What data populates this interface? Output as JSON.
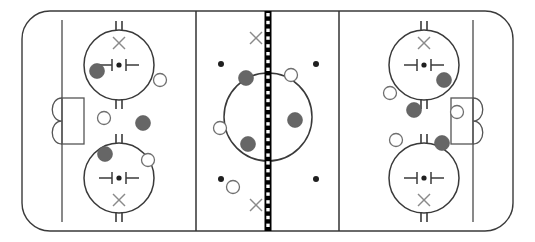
{
  "diagram": {
    "type": "hockey-rink-play-diagram",
    "canvas": {
      "width": 535,
      "height": 242
    },
    "colors": {
      "background": "#ffffff",
      "boundary": "#3a3a3a",
      "zone_line": "#333333",
      "center_line_black": "#000000",
      "center_line_white": "#ffffff",
      "goal_line": "#4a4a4a",
      "crease": "#555555",
      "faceoff_circle": "#3a3a3a",
      "x_mark": "#8a8a8a",
      "dot": "#1f1f1f",
      "player_filled": "#666666",
      "player_open_stroke": "#6f6f6f",
      "player_open_fill": "#ffffff"
    }
  },
  "rink": {
    "boundary": {
      "x": 22,
      "y": 11,
      "width": 491,
      "height": 220,
      "corner_radius": 28
    },
    "zone_lines": [
      {
        "name": "left-blue-line",
        "x": 196,
        "y1": 11,
        "y2": 231
      },
      {
        "name": "right-blue-line",
        "x": 339,
        "y1": 11,
        "y2": 231
      }
    ],
    "center_line": {
      "name": "center-red-line",
      "x": 268,
      "y1": 11,
      "y2": 231,
      "bar_width": 7,
      "segment_height": 7.8,
      "inner_square": 3.4
    },
    "goal_lines": [
      {
        "name": "left-goal-line",
        "x": 62,
        "y1": 20,
        "y2": 222
      },
      {
        "name": "right-goal-line",
        "x": 473,
        "y1": 20,
        "y2": 222
      }
    ],
    "goals": [
      {
        "name": "left-goal",
        "crease": {
          "x": 62,
          "y": 98,
          "width": 22,
          "height": 46
        },
        "net_side": "left"
      },
      {
        "name": "right-goal",
        "crease": {
          "x": 451,
          "y": 98,
          "width": 22,
          "height": 46
        },
        "net_side": "right"
      }
    ],
    "faceoff_circles": [
      {
        "name": "faceoff-circle-top-left",
        "cx": 119,
        "cy": 65,
        "r": 35,
        "x_mark": "above"
      },
      {
        "name": "faceoff-circle-bottom-left",
        "cx": 119,
        "cy": 178,
        "r": 35,
        "x_mark": "below"
      },
      {
        "name": "faceoff-circle-top-right",
        "cx": 424,
        "cy": 65,
        "r": 35,
        "x_mark": "above"
      },
      {
        "name": "faceoff-circle-bottom-right",
        "cx": 424,
        "cy": 178,
        "r": 35,
        "x_mark": "below"
      },
      {
        "name": "faceoff-circle-center",
        "cx": 268,
        "cy": 117,
        "r": 44,
        "x_mark": "none"
      }
    ],
    "neutral_zone_dots": [
      {
        "name": "neutral-dot-top-left",
        "cx": 221,
        "cy": 64
      },
      {
        "name": "neutral-dot-top-right",
        "cx": 316,
        "cy": 64
      },
      {
        "name": "neutral-dot-bottom-left",
        "cx": 221,
        "cy": 179
      },
      {
        "name": "neutral-dot-bottom-right",
        "cx": 316,
        "cy": 179
      }
    ],
    "neutral_zone_x_marks": [
      {
        "name": "neutral-x-top",
        "cx": 256,
        "cy": 38
      },
      {
        "name": "neutral-x-bottom",
        "cx": 256,
        "cy": 205
      }
    ]
  },
  "players": {
    "filled_label": "Defending / dark team player",
    "open_label": "Attacking / light team player",
    "filled": [
      {
        "name": "player-dark-1",
        "cx": 97,
        "cy": 71,
        "r": 7.5
      },
      {
        "name": "player-dark-2",
        "cx": 143,
        "cy": 123,
        "r": 7.5
      },
      {
        "name": "player-dark-3",
        "cx": 105,
        "cy": 154,
        "r": 7.5
      },
      {
        "name": "player-dark-4",
        "cx": 246,
        "cy": 78,
        "r": 7.5
      },
      {
        "name": "player-dark-5",
        "cx": 295,
        "cy": 120,
        "r": 7.5
      },
      {
        "name": "player-dark-6",
        "cx": 248,
        "cy": 144,
        "r": 7.5
      },
      {
        "name": "player-dark-7",
        "cx": 444,
        "cy": 80,
        "r": 7.5
      },
      {
        "name": "player-dark-8",
        "cx": 414,
        "cy": 110,
        "r": 7.5
      },
      {
        "name": "player-dark-9",
        "cx": 442,
        "cy": 143,
        "r": 7.5
      }
    ],
    "open": [
      {
        "name": "player-light-1",
        "cx": 160,
        "cy": 80,
        "r": 6.5
      },
      {
        "name": "player-light-2",
        "cx": 104,
        "cy": 118,
        "r": 6.5
      },
      {
        "name": "player-light-3",
        "cx": 148,
        "cy": 160,
        "r": 6.5
      },
      {
        "name": "player-light-4",
        "cx": 291,
        "cy": 75,
        "r": 6.5
      },
      {
        "name": "player-light-5",
        "cx": 220,
        "cy": 128,
        "r": 6.5
      },
      {
        "name": "player-light-6",
        "cx": 233,
        "cy": 187,
        "r": 6.5
      },
      {
        "name": "player-light-7",
        "cx": 390,
        "cy": 93,
        "r": 6.5
      },
      {
        "name": "player-light-8",
        "cx": 457,
        "cy": 112,
        "r": 6.5
      },
      {
        "name": "player-light-9",
        "cx": 396,
        "cy": 140,
        "r": 6.5
      }
    ]
  }
}
